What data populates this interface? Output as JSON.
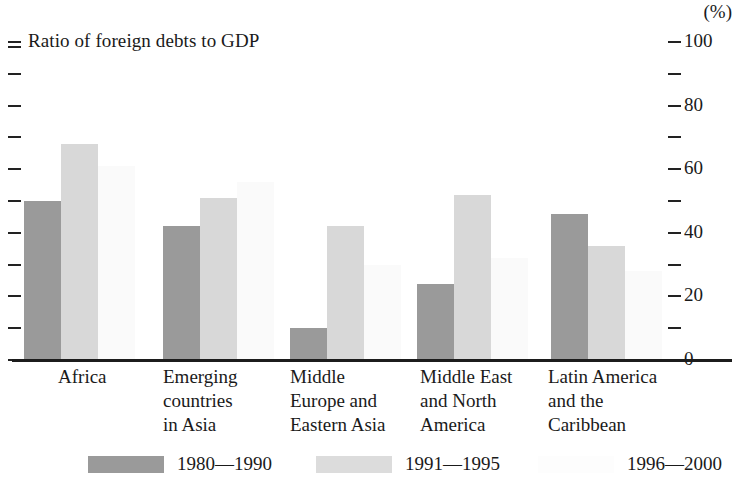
{
  "chart_data": {
    "type": "bar",
    "title": "Ratio of foreign debts to GDP",
    "unit_label": "(%)",
    "xlabel": "",
    "ylabel": "",
    "ylim": [
      0,
      100
    ],
    "grid": false,
    "legend_position": "bottom",
    "y_ticks_major": [
      "100",
      "80",
      "60",
      "40",
      "20",
      "0"
    ],
    "y_tick_values_major": [
      100,
      80,
      60,
      40,
      20,
      0
    ],
    "y_tick_values_minor": [
      90,
      70,
      50,
      30,
      10
    ],
    "categories": [
      "Africa",
      "Emerging\ncountries\nin Asia",
      "Middle\nEurope and\nEastern Asia",
      "Middle East\nand North\nAmerica",
      "Latin America\nand the\nCaribbean"
    ],
    "series": [
      {
        "name": "1980—1990",
        "color": "#9a9a9a",
        "values": [
          50,
          42,
          10,
          24,
          46
        ]
      },
      {
        "name": "1991—1995",
        "color": "#d8d8d8",
        "values": [
          68,
          51,
          42,
          52,
          36
        ]
      },
      {
        "name": "1996—2000",
        "color": "#fafafa",
        "values": [
          61,
          56,
          30,
          32,
          28
        ]
      }
    ]
  },
  "legend": {
    "items": [
      {
        "label": "1980—1990",
        "swatch": "dark-gray-swatch"
      },
      {
        "label": "1991—1995",
        "swatch": "light-gray-swatch"
      },
      {
        "label": "1996—2000",
        "swatch": "white-swatch"
      }
    ]
  }
}
